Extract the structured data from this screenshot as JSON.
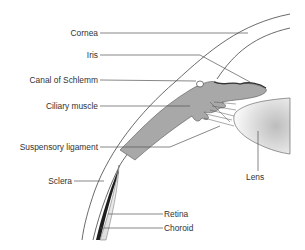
{
  "diagram": {
    "labels": {
      "cornea": "Cornea",
      "iris": "Iris",
      "canal": "Canal of Schlemm",
      "ciliary": "Ciliary muscle",
      "suspensory": "Suspensory ligament",
      "sclera": "Sclera",
      "lens": "Lens",
      "retina": "Retina",
      "choroid": "Choroid"
    },
    "colors": {
      "muscle": "#a8a8a8",
      "muscle_edge": "#555555",
      "lens_shade": "#cfcfcf",
      "line": "#555555",
      "text": "#333333"
    }
  }
}
